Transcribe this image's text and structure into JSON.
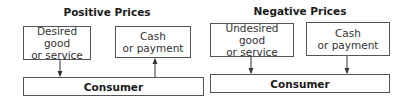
{
  "panels": [
    {
      "title": "Positive Prices",
      "left_box": {
        "line1": "Desired good",
        "line2": "or service"
      },
      "right_box": {
        "line1": "Cash",
        "line2": "or payment"
      },
      "bottom_box": "Consumer",
      "left_arrow": "down",
      "right_arrow": "up"
    },
    {
      "title": "Negative Prices",
      "left_box": {
        "line1": "Undesired good",
        "line2": "or service"
      },
      "right_box": {
        "line1": "Cash",
        "line2": "or payment"
      },
      "bottom_box": "Consumer",
      "left_arrow": "down",
      "right_arrow": "down"
    }
  ],
  "colors": {
    "stroke": "#555555",
    "text": "#1a1a1a",
    "background": "#ffffff"
  }
}
